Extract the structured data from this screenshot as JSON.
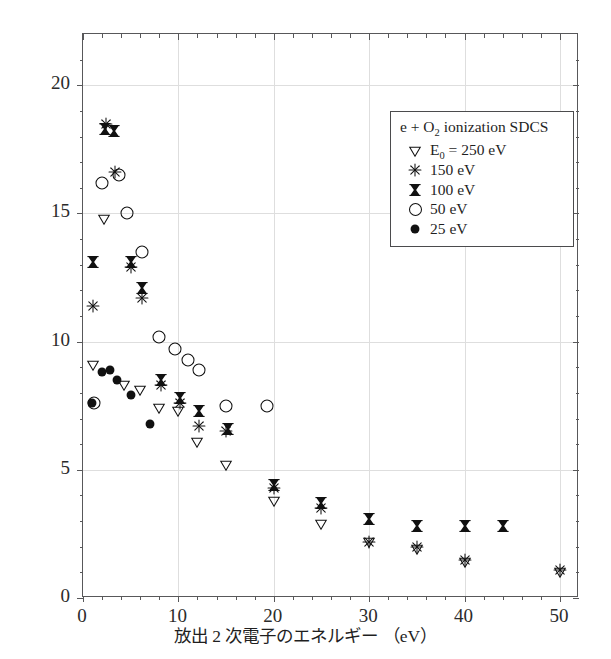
{
  "chart_data": {
    "type": "scatter",
    "title": "",
    "xlabel": "放出 2 次電子のエネルギー （eV）",
    "ylabel": "1 次微分断面積 （10⁻¹⁸ cm²/eV）",
    "xlim": [
      0,
      52
    ],
    "ylim": [
      0,
      22
    ],
    "xticks": [
      0,
      10,
      20,
      30,
      40,
      50
    ],
    "yticks": [
      0,
      5,
      10,
      15,
      20
    ],
    "xtick_labels": [
      "0",
      "10",
      "20",
      "30",
      "40",
      "50"
    ],
    "ytick_labels": [
      "0",
      "5",
      "10",
      "15",
      "20"
    ],
    "grid": true,
    "legend_position": "upper-right",
    "legend_title": "e + O₂ ionization SDCS",
    "series": [
      {
        "name": "E₀ = 250 eV",
        "label": "E_0 = 250 eV",
        "marker": "open-down-triangle",
        "color": "#111111",
        "points": [
          {
            "x": 1.0,
            "y": 9.1
          },
          {
            "x": 2.2,
            "y": 14.8
          },
          {
            "x": 4.3,
            "y": 8.3
          },
          {
            "x": 6.0,
            "y": 8.1
          },
          {
            "x": 8.0,
            "y": 7.4
          },
          {
            "x": 10.0,
            "y": 7.3
          },
          {
            "x": 12.0,
            "y": 6.1
          },
          {
            "x": 15.0,
            "y": 5.2
          },
          {
            "x": 20.0,
            "y": 3.8
          },
          {
            "x": 25.0,
            "y": 2.9
          },
          {
            "x": 30.0,
            "y": 2.2
          },
          {
            "x": 35.0,
            "y": 1.9
          },
          {
            "x": 40.0,
            "y": 1.4
          },
          {
            "x": 50.0,
            "y": 1.0
          }
        ]
      },
      {
        "name": "150 eV",
        "label": "150 eV",
        "marker": "asterisk",
        "color": "#111111",
        "points": [
          {
            "x": 1.0,
            "y": 11.4
          },
          {
            "x": 2.4,
            "y": 18.5
          },
          {
            "x": 3.4,
            "y": 16.6
          },
          {
            "x": 5.0,
            "y": 12.9
          },
          {
            "x": 6.2,
            "y": 11.7
          },
          {
            "x": 8.2,
            "y": 8.3
          },
          {
            "x": 10.2,
            "y": 7.6
          },
          {
            "x": 12.2,
            "y": 6.7
          },
          {
            "x": 15.0,
            "y": 6.5
          },
          {
            "x": 20.0,
            "y": 4.3
          },
          {
            "x": 25.0,
            "y": 3.5
          },
          {
            "x": 30.0,
            "y": 2.2
          },
          {
            "x": 35.0,
            "y": 2.0
          },
          {
            "x": 40.0,
            "y": 1.5
          },
          {
            "x": 50.0,
            "y": 1.1
          }
        ]
      },
      {
        "name": "100 eV",
        "label": "100 eV",
        "marker": "hourglass",
        "color": "#111111",
        "points": [
          {
            "x": 1.0,
            "y": 13.1
          },
          {
            "x": 2.3,
            "y": 18.3
          },
          {
            "x": 3.3,
            "y": 18.2
          },
          {
            "x": 5.0,
            "y": 13.1
          },
          {
            "x": 6.2,
            "y": 12.1
          },
          {
            "x": 8.2,
            "y": 8.5
          },
          {
            "x": 10.2,
            "y": 7.8
          },
          {
            "x": 12.2,
            "y": 7.3
          },
          {
            "x": 15.2,
            "y": 6.6
          },
          {
            "x": 20.0,
            "y": 4.4
          },
          {
            "x": 25.0,
            "y": 3.7
          },
          {
            "x": 30.0,
            "y": 3.1
          },
          {
            "x": 35.0,
            "y": 2.8
          },
          {
            "x": 40.0,
            "y": 2.8
          },
          {
            "x": 44.0,
            "y": 2.8
          }
        ]
      },
      {
        "name": "50 eV",
        "label": "50 eV",
        "marker": "open-circle",
        "color": "#111111",
        "points": [
          {
            "x": 1.2,
            "y": 7.6
          },
          {
            "x": 2.0,
            "y": 16.2
          },
          {
            "x": 3.8,
            "y": 16.5
          },
          {
            "x": 4.6,
            "y": 15.0
          },
          {
            "x": 6.2,
            "y": 13.5
          },
          {
            "x": 8.0,
            "y": 10.2
          },
          {
            "x": 9.6,
            "y": 9.7
          },
          {
            "x": 11.0,
            "y": 9.3
          },
          {
            "x": 12.2,
            "y": 8.9
          },
          {
            "x": 15.0,
            "y": 7.5
          },
          {
            "x": 19.3,
            "y": 7.5
          }
        ]
      },
      {
        "name": "25 eV",
        "label": "25 eV",
        "marker": "filled-circle",
        "color": "#111111",
        "points": [
          {
            "x": 0.9,
            "y": 7.6
          },
          {
            "x": 2.0,
            "y": 8.8
          },
          {
            "x": 2.8,
            "y": 8.9
          },
          {
            "x": 3.6,
            "y": 8.5
          },
          {
            "x": 5.0,
            "y": 7.9
          },
          {
            "x": 7.0,
            "y": 6.8
          }
        ]
      }
    ]
  },
  "legend": {
    "title": "e + O",
    "title_sub": "2",
    "title_rest": " ionization SDCS",
    "rows": [
      {
        "symbol": "open-down-triangle",
        "text_main": "E",
        "text_sub": "0",
        "text_rest": " = 250 eV"
      },
      {
        "symbol": "asterisk",
        "text_main": "150 eV",
        "text_sub": "",
        "text_rest": ""
      },
      {
        "symbol": "hourglass",
        "text_main": "100 eV",
        "text_sub": "",
        "text_rest": ""
      },
      {
        "symbol": "open-circle",
        "text_main": "50 eV",
        "text_sub": "",
        "text_rest": ""
      },
      {
        "symbol": "filled-circle",
        "text_main": "25 eV",
        "text_sub": "",
        "text_rest": ""
      }
    ]
  },
  "axes": {
    "y_title_main": "1 次微分断面積 （10",
    "y_title_exp": "−18",
    "y_title_rest": " cm²/eV）",
    "x_title": "放出 2 次電子のエネルギー （eV）"
  },
  "colors": {
    "ink": "#111111",
    "frame": "#58585a",
    "grid": "#dedede",
    "background": "#ffffff"
  }
}
